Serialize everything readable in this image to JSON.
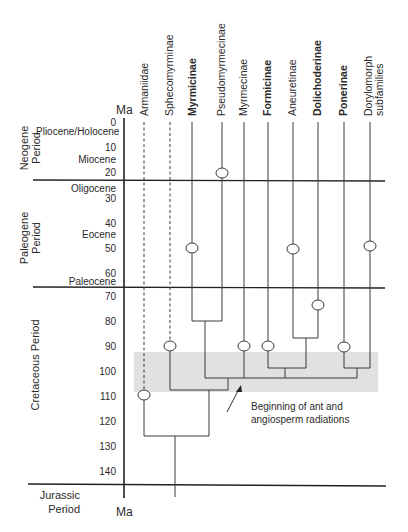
{
  "axis": {
    "unit_label_top": "Ma",
    "unit_label_bottom": "Ma",
    "ticks": [
      "0",
      "10",
      "20",
      "30",
      "40",
      "50",
      "60",
      "70",
      "80",
      "90",
      "100",
      "110",
      "120",
      "130",
      "140"
    ]
  },
  "periods": {
    "neogene": "Neogene\nPeriod",
    "paleogene": "Paleogene\nPeriod",
    "cretaceous": "Cretaceous Period",
    "jurassic": "Jurassic\nPeriod"
  },
  "epochs": {
    "pliocene_holocene": "Pliocene/Holocene",
    "miocene": "Miocene",
    "oligocene": "Oligocene",
    "eocene": "Eocene",
    "paleocene": "Paleocene"
  },
  "taxa": [
    {
      "name": "Armaniidae",
      "bold": false,
      "dashed": true
    },
    {
      "name": "Sphecomyrminae",
      "bold": false,
      "dashed": true
    },
    {
      "name": "Myrmicinae",
      "bold": true,
      "dashed": false
    },
    {
      "name": "Pseudomyrmecinae",
      "bold": false,
      "dashed": false
    },
    {
      "name": "Myrmecinae",
      "bold": false,
      "dashed": false
    },
    {
      "name": "Formicinae",
      "bold": true,
      "dashed": false
    },
    {
      "name": "Aneuretinae",
      "bold": false,
      "dashed": false
    },
    {
      "name": "Dolichoderinae",
      "bold": true,
      "dashed": false
    },
    {
      "name": "Ponerinae",
      "bold": true,
      "dashed": false
    },
    {
      "name": "Dorylomorph\nsubfamilies",
      "bold": false,
      "dashed": false
    }
  ],
  "annotation": {
    "text": "Beginning of ant and\nangiosperm radiations",
    "shaded_band_ma": [
      92,
      108
    ]
  },
  "fossil_first_appearance_ma": {
    "Armaniidae": 110,
    "Sphecomyrminae": 90,
    "Myrmicinae": 51,
    "Pseudomyrmecinae": 21,
    "Myrmecinae": 90,
    "Formicinae": 90,
    "Aneuretinae": 51,
    "Dolichoderinae": 74,
    "Ponerinae": 90,
    "Dorylomorph subfamilies": 50
  },
  "colors": {
    "line": "#333333",
    "band": "#d9d9d9"
  }
}
